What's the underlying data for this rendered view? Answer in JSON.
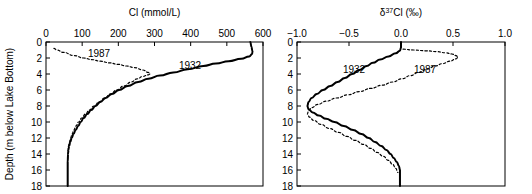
{
  "figure": {
    "background": "#ffffff",
    "width": 532,
    "height": 194,
    "shared_y_axis_label": "Depth (m below Lake Bottom)"
  },
  "chart_data": [
    {
      "type": "line",
      "panel": "left",
      "title": "Cl (mmol/L)",
      "xlabel": "Cl (mmol/L)",
      "ylabel": "Depth (m below Lake Bottom)",
      "xlim": [
        0,
        600
      ],
      "ylim": [
        0,
        18
      ],
      "y_inverted": true,
      "x_axis_position": "top",
      "grid": false,
      "legend": "inline-annotations",
      "xticks": [
        0,
        100,
        200,
        300,
        400,
        500,
        600
      ],
      "xticklabels": [
        "0",
        "100",
        "200",
        "300",
        "400",
        "500",
        "600"
      ],
      "yticks": [
        0,
        2,
        4,
        6,
        8,
        10,
        12,
        14,
        16,
        18
      ],
      "yticklabels": [
        "0",
        "2",
        "4",
        "6",
        "8",
        "10",
        "12",
        "14",
        "16",
        "18"
      ],
      "series": [
        {
          "name": "1932",
          "style": "solid",
          "color": "#000000",
          "label_text": "1932",
          "points": [
            {
              "depth": 0.0,
              "value": 565
            },
            {
              "depth": 0.6,
              "value": 568
            },
            {
              "depth": 1.2,
              "value": 571
            },
            {
              "depth": 1.5,
              "value": 570
            },
            {
              "depth": 1.8,
              "value": 562
            },
            {
              "depth": 2.1,
              "value": 540
            },
            {
              "depth": 2.4,
              "value": 505
            },
            {
              "depth": 2.7,
              "value": 470
            },
            {
              "depth": 3.0,
              "value": 435
            },
            {
              "depth": 3.4,
              "value": 392
            },
            {
              "depth": 3.8,
              "value": 352
            },
            {
              "depth": 4.2,
              "value": 315
            },
            {
              "depth": 4.6,
              "value": 283
            },
            {
              "depth": 5.0,
              "value": 255
            },
            {
              "depth": 5.5,
              "value": 226
            },
            {
              "depth": 6.0,
              "value": 202
            },
            {
              "depth": 6.5,
              "value": 182
            },
            {
              "depth": 7.0,
              "value": 165
            },
            {
              "depth": 7.5,
              "value": 150
            },
            {
              "depth": 8.0,
              "value": 137
            },
            {
              "depth": 8.5,
              "value": 125
            },
            {
              "depth": 9.0,
              "value": 114
            },
            {
              "depth": 9.5,
              "value": 104
            },
            {
              "depth": 10.0,
              "value": 96
            },
            {
              "depth": 10.5,
              "value": 89
            },
            {
              "depth": 11.0,
              "value": 82
            },
            {
              "depth": 11.5,
              "value": 76
            },
            {
              "depth": 12.0,
              "value": 71
            },
            {
              "depth": 12.5,
              "value": 67
            },
            {
              "depth": 13.0,
              "value": 64
            },
            {
              "depth": 13.5,
              "value": 62
            },
            {
              "depth": 14.0,
              "value": 61
            },
            {
              "depth": 15.0,
              "value": 60
            },
            {
              "depth": 16.0,
              "value": 60
            },
            {
              "depth": 17.0,
              "value": 60
            },
            {
              "depth": 18.0,
              "value": 60
            }
          ]
        },
        {
          "name": "1987",
          "style": "dotted",
          "color": "#000000",
          "label_text": "1987",
          "points": [
            {
              "depth": 0.8,
              "value": 22
            },
            {
              "depth": 1.0,
              "value": 30
            },
            {
              "depth": 1.3,
              "value": 48
            },
            {
              "depth": 1.7,
              "value": 78
            },
            {
              "depth": 2.0,
              "value": 104
            },
            {
              "depth": 2.2,
              "value": 126
            },
            {
              "depth": 2.4,
              "value": 150
            },
            {
              "depth": 2.6,
              "value": 175
            },
            {
              "depth": 2.8,
              "value": 200
            },
            {
              "depth": 3.0,
              "value": 222
            },
            {
              "depth": 3.2,
              "value": 244
            },
            {
              "depth": 3.5,
              "value": 268
            },
            {
              "depth": 3.8,
              "value": 283
            },
            {
              "depth": 4.0,
              "value": 288
            },
            {
              "depth": 4.1,
              "value": 283
            },
            {
              "depth": 4.3,
              "value": 268
            },
            {
              "depth": 4.6,
              "value": 252
            },
            {
              "depth": 5.0,
              "value": 236
            },
            {
              "depth": 5.5,
              "value": 215
            },
            {
              "depth": 6.0,
              "value": 196
            },
            {
              "depth": 6.5,
              "value": 178
            },
            {
              "depth": 7.0,
              "value": 162
            },
            {
              "depth": 7.5,
              "value": 147
            },
            {
              "depth": 8.0,
              "value": 133
            },
            {
              "depth": 8.5,
              "value": 120
            },
            {
              "depth": 9.0,
              "value": 109
            },
            {
              "depth": 9.5,
              "value": 99
            },
            {
              "depth": 10.0,
              "value": 90
            },
            {
              "depth": 10.5,
              "value": 83
            },
            {
              "depth": 11.0,
              "value": 77
            },
            {
              "depth": 11.5,
              "value": 72
            },
            {
              "depth": 12.0,
              "value": 68
            },
            {
              "depth": 12.5,
              "value": 65
            },
            {
              "depth": 13.0,
              "value": 62
            },
            {
              "depth": 13.5,
              "value": 61
            },
            {
              "depth": 14.0,
              "value": 60
            }
          ]
        }
      ]
    },
    {
      "type": "line",
      "panel": "right",
      "title": "d37Cl (per mille)",
      "title_parts": {
        "delta": "δ",
        "superscript": "37",
        "element": "Cl",
        "unit": "(‰)"
      },
      "xlabel": "δ³⁷Cl (‰)",
      "ylabel": "Depth (m below Lake Bottom)",
      "xlim": [
        -1.0,
        1.0
      ],
      "ylim": [
        0,
        18
      ],
      "y_inverted": true,
      "x_axis_position": "top",
      "grid": false,
      "legend": "inline-annotations",
      "xticks": [
        -1.0,
        -0.5,
        0.0,
        0.5,
        1.0
      ],
      "xticklabels": [
        "−1.0",
        "−0.5",
        "0.0",
        "0.5",
        "1.0"
      ],
      "yticks": [
        0,
        2,
        4,
        6,
        8,
        10,
        12,
        14,
        16,
        18
      ],
      "yticklabels": [
        "0",
        "2",
        "4",
        "6",
        "8",
        "10",
        "12",
        "14",
        "16",
        "18"
      ],
      "series": [
        {
          "name": "1932",
          "style": "solid",
          "color": "#000000",
          "label_text": "1932",
          "points": [
            {
              "depth": 0.0,
              "value": 0.0
            },
            {
              "depth": 0.7,
              "value": 0.0
            },
            {
              "depth": 1.1,
              "value": -0.01
            },
            {
              "depth": 1.4,
              "value": -0.05
            },
            {
              "depth": 1.8,
              "value": -0.12
            },
            {
              "depth": 2.2,
              "value": -0.2
            },
            {
              "depth": 2.6,
              "value": -0.27
            },
            {
              "depth": 3.0,
              "value": -0.33
            },
            {
              "depth": 3.5,
              "value": -0.4
            },
            {
              "depth": 4.0,
              "value": -0.47
            },
            {
              "depth": 4.5,
              "value": -0.54
            },
            {
              "depth": 5.0,
              "value": -0.61
            },
            {
              "depth": 5.5,
              "value": -0.68
            },
            {
              "depth": 6.0,
              "value": -0.75
            },
            {
              "depth": 6.5,
              "value": -0.81
            },
            {
              "depth": 7.0,
              "value": -0.86
            },
            {
              "depth": 7.5,
              "value": -0.89
            },
            {
              "depth": 8.0,
              "value": -0.9
            },
            {
              "depth": 8.4,
              "value": -0.89
            },
            {
              "depth": 8.8,
              "value": -0.85
            },
            {
              "depth": 9.2,
              "value": -0.79
            },
            {
              "depth": 9.6,
              "value": -0.72
            },
            {
              "depth": 10.0,
              "value": -0.64
            },
            {
              "depth": 10.5,
              "value": -0.55
            },
            {
              "depth": 11.0,
              "value": -0.46
            },
            {
              "depth": 11.5,
              "value": -0.38
            },
            {
              "depth": 12.0,
              "value": -0.31
            },
            {
              "depth": 12.5,
              "value": -0.25
            },
            {
              "depth": 13.0,
              "value": -0.19
            },
            {
              "depth": 13.5,
              "value": -0.14
            },
            {
              "depth": 14.0,
              "value": -0.1
            },
            {
              "depth": 14.5,
              "value": -0.07
            },
            {
              "depth": 15.0,
              "value": -0.04
            },
            {
              "depth": 15.5,
              "value": -0.02
            },
            {
              "depth": 16.0,
              "value": -0.01
            },
            {
              "depth": 17.0,
              "value": -0.01
            },
            {
              "depth": 18.0,
              "value": -0.01
            }
          ]
        },
        {
          "name": "1987",
          "style": "dotted",
          "color": "#000000",
          "label_text": "1987",
          "points": [
            {
              "depth": 0.9,
              "value": 0.02
            },
            {
              "depth": 1.0,
              "value": 0.12
            },
            {
              "depth": 1.1,
              "value": 0.24
            },
            {
              "depth": 1.2,
              "value": 0.34
            },
            {
              "depth": 1.35,
              "value": 0.43
            },
            {
              "depth": 1.5,
              "value": 0.49
            },
            {
              "depth": 1.7,
              "value": 0.53
            },
            {
              "depth": 1.9,
              "value": 0.55
            },
            {
              "depth": 2.1,
              "value": 0.53
            },
            {
              "depth": 2.4,
              "value": 0.47
            },
            {
              "depth": 2.7,
              "value": 0.4
            },
            {
              "depth": 3.0,
              "value": 0.33
            },
            {
              "depth": 3.4,
              "value": 0.25
            },
            {
              "depth": 3.8,
              "value": 0.17
            },
            {
              "depth": 4.2,
              "value": 0.09
            },
            {
              "depth": 4.6,
              "value": 0.01
            },
            {
              "depth": 5.0,
              "value": -0.08
            },
            {
              "depth": 5.4,
              "value": -0.18
            },
            {
              "depth": 5.8,
              "value": -0.29
            },
            {
              "depth": 6.2,
              "value": -0.4
            },
            {
              "depth": 6.6,
              "value": -0.51
            },
            {
              "depth": 7.0,
              "value": -0.62
            },
            {
              "depth": 7.4,
              "value": -0.72
            },
            {
              "depth": 7.8,
              "value": -0.8
            },
            {
              "depth": 8.2,
              "value": -0.86
            },
            {
              "depth": 8.6,
              "value": -0.89
            },
            {
              "depth": 9.0,
              "value": -0.9
            },
            {
              "depth": 9.4,
              "value": -0.88
            },
            {
              "depth": 9.8,
              "value": -0.84
            },
            {
              "depth": 10.3,
              "value": -0.77
            },
            {
              "depth": 10.8,
              "value": -0.69
            },
            {
              "depth": 11.3,
              "value": -0.6
            },
            {
              "depth": 11.8,
              "value": -0.52
            },
            {
              "depth": 12.3,
              "value": -0.44
            },
            {
              "depth": 12.8,
              "value": -0.36
            },
            {
              "depth": 13.3,
              "value": -0.29
            },
            {
              "depth": 13.8,
              "value": -0.23
            },
            {
              "depth": 14.3,
              "value": -0.17
            },
            {
              "depth": 14.8,
              "value": -0.12
            },
            {
              "depth": 15.3,
              "value": -0.08
            },
            {
              "depth": 15.8,
              "value": -0.05
            },
            {
              "depth": 16.3,
              "value": -0.03
            }
          ]
        }
      ]
    }
  ],
  "annotations": {
    "left_1932": "1932",
    "left_1987": "1987",
    "right_1932": "1932",
    "right_1987": "1987"
  }
}
